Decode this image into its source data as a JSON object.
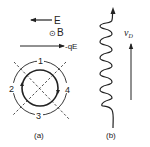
{
  "panel_a": {
    "caption": "(a)",
    "field_e_label": "E",
    "field_b_symbol": "⊙",
    "field_b_label": "B",
    "force_label": "-qE",
    "regions": [
      "1",
      "2",
      "3",
      "4"
    ]
  },
  "panel_b": {
    "caption": "(b)",
    "drift_velocity_label": "v",
    "drift_velocity_subscript": "D",
    "helix_loops": 5
  },
  "colors": {
    "ink": "#222222",
    "background": "#ffffff"
  }
}
